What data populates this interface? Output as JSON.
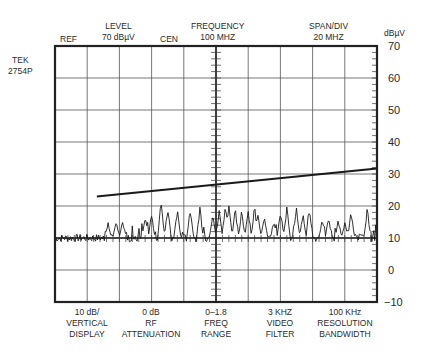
{
  "instrument": {
    "model_line1": "TEK",
    "model_line2": "2754P"
  },
  "header": {
    "ref": "REF",
    "level_line1": "LEVEL",
    "level_line2": "70 dBµV",
    "cen": "CEN",
    "frequency_line1": "FREQUENCY",
    "frequency_line2": "100 MHZ",
    "span_line1": "SPAN/DIV",
    "span_line2": "20 MHZ",
    "unit": "dBµV"
  },
  "footer": [
    {
      "value": "10 dB/",
      "line2": "VERTICAL",
      "line3": "DISPLAY"
    },
    {
      "value": "0 dB",
      "line2": "RF",
      "line3": "ATTENUATION"
    },
    {
      "value": "0–1.8",
      "line2": "FREQ",
      "line3": "RANGE"
    },
    {
      "value": "3 KHZ",
      "line2": "VIDEO",
      "line3": "FILTER"
    },
    {
      "value": "100 KHz",
      "line2": "RESOLUTION",
      "line3": "BANDWIDTH"
    }
  ],
  "y_ticks": [
    "70",
    "60",
    "50",
    "40",
    "30",
    "20",
    "10",
    "0",
    "−10"
  ],
  "colors": {
    "trace": "#1a1a1a",
    "grid": "#555555",
    "frame": "#222222"
  },
  "chart_data": {
    "type": "line",
    "xlabel": "Frequency (center 100 MHz, 20 MHz/div, 10 divisions)",
    "ylabel": "dBµV",
    "xlim": [
      0,
      200
    ],
    "x_unit": "MHz",
    "ylim": [
      -10,
      70
    ],
    "y_ticks": [
      70,
      60,
      50,
      40,
      30,
      20,
      10,
      0,
      -10
    ],
    "grid": true,
    "divisions": {
      "x": 10,
      "y": 8
    },
    "noise_floor_dBuV": 10,
    "series": [
      {
        "name": "Limit line",
        "x": [
          26,
          200
        ],
        "values": [
          23,
          31.7
        ]
      },
      {
        "name": "Emission peaks",
        "x": [
          33,
          38,
          42,
          56,
          60,
          66,
          70,
          76,
          84,
          90,
          98,
          102,
          106,
          108,
          112,
          116,
          120,
          124,
          126,
          130,
          136,
          140,
          144,
          150,
          154,
          158,
          166,
          170,
          176,
          180,
          184,
          194
        ],
        "values": [
          15,
          16,
          16,
          17,
          18,
          23,
          20,
          20,
          20,
          20,
          18,
          20,
          21,
          22,
          20,
          19,
          20,
          21,
          19,
          18,
          15,
          20,
          20,
          20,
          18,
          21,
          16,
          17,
          16,
          15,
          19,
          20
        ]
      }
    ]
  }
}
